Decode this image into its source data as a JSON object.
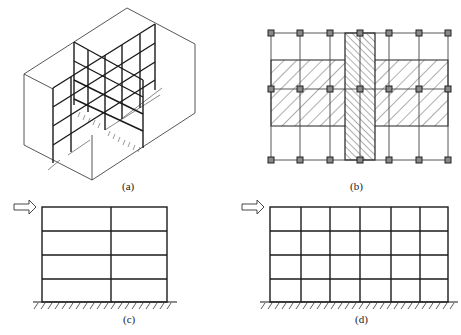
{
  "figure": {
    "panels": [
      {
        "id": "a",
        "label": "(a)",
        "description": "3D view of frame structure with intersecting plane frames inside a building volume"
      },
      {
        "id": "b",
        "label": "(b)",
        "description": "Plan view: column grid 7 x 3 with hatched horizontal and vertical strips"
      },
      {
        "id": "c",
        "label": "(c)",
        "description": "2-bay, 4-story plane frame with lateral load arrow and fixed base"
      },
      {
        "id": "d",
        "label": "(d)",
        "description": "6-bay, 4-story plane frame with lateral load arrow and fixed base"
      }
    ],
    "plan_b": {
      "columns_x": 7,
      "rows_y": 3
    },
    "frame_c": {
      "bays": 2,
      "stories": 4
    },
    "frame_d": {
      "bays": 6,
      "stories": 4
    }
  },
  "colors": {
    "line": "#1a1a1a",
    "thin": "#444444",
    "background": "#ffffff"
  }
}
